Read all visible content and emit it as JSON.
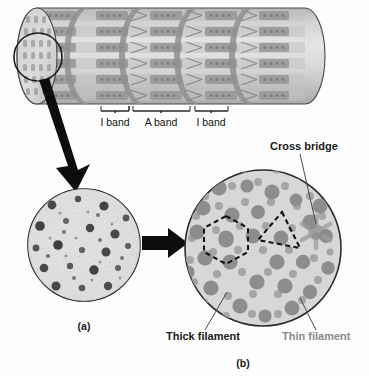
{
  "figure": {
    "title_caption_a": "(a)",
    "title_caption_b": "(b)"
  },
  "bands": {
    "i_band_left": "I band",
    "a_band": "A band",
    "i_band_right": "I band"
  },
  "labels": {
    "cross_bridge": "Cross bridge",
    "thick_filament": "Thick filament",
    "thin_filament": "Thin filament"
  },
  "colors": {
    "thick_filament": "#8d8d8d",
    "thin_filament": "#a5a5a5",
    "cylinder_body": "#c9c9c9",
    "cylinder_light": "#e3e3e3",
    "z_disc": "#8f8f8f",
    "circle_b_fill": "#d7d7d7",
    "outline": "#3a3a3a",
    "arrow": "#111111",
    "thin_label_gray": "#8a8a8a",
    "text_dark": "#1a1a1a"
  },
  "structure": {
    "cylinder": {
      "myofibril_rows": 7,
      "z_disc_count": 4,
      "sarcomere_count": 4
    },
    "micrograph_a": {
      "description": "electron micrograph cross-section",
      "blob_count": 26
    },
    "cross_section_b": {
      "thick_filament_count": 22,
      "thin_filament_count": 44,
      "hexagon_vertices": 6,
      "triangle_vertices": 3
    }
  }
}
